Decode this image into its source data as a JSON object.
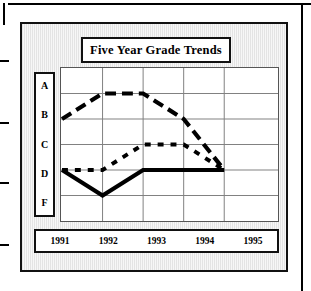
{
  "title": "Five Year Grade Trends",
  "y_axis": {
    "labels": [
      "A",
      "B",
      "C",
      "D",
      "F"
    ]
  },
  "x_axis": {
    "labels": [
      "1991",
      "1992",
      "1993",
      "1994",
      "1995"
    ]
  },
  "colors": {
    "line": "#000000",
    "grid": "#808080",
    "panel_background": "#ececec",
    "box_background": "#ffffff",
    "frame": "#111111"
  },
  "chart_data": {
    "type": "line",
    "title": "Five Year Grade Trends",
    "xlabel": "",
    "ylabel": "",
    "x": [
      "1991",
      "1992",
      "1993",
      "1994",
      "1995"
    ],
    "ytick_labels": [
      "A",
      "B",
      "C",
      "D",
      "F"
    ],
    "ytick_values": [
      4,
      3,
      2,
      1,
      0
    ],
    "ylim": [
      -0.5,
      4.5
    ],
    "grid": true,
    "legend": "none",
    "series": [
      {
        "name": "Series 1",
        "style": "dashed-thick",
        "values": [
          "B",
          "A",
          "A",
          "B",
          "D"
        ],
        "numeric_values": [
          3,
          4,
          4,
          3,
          1
        ]
      },
      {
        "name": "Series 2",
        "style": "dashed-short",
        "values": [
          "D",
          "D",
          "C",
          "C",
          "D"
        ],
        "numeric_values": [
          1,
          1,
          2,
          2,
          1
        ]
      },
      {
        "name": "Series 3",
        "style": "solid-thick",
        "values": [
          "D",
          "F",
          "D",
          "D",
          "D"
        ],
        "numeric_values": [
          1,
          0,
          1,
          1,
          1
        ]
      }
    ]
  }
}
